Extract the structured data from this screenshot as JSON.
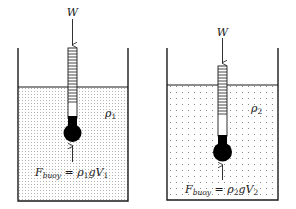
{
  "diagram": {
    "type": "physics-buoyancy-hydrometer",
    "colors": {
      "line": "#1a1a1a",
      "liquid_dots": "#8a8a8a",
      "bulb": "#000000",
      "background": "#ffffff"
    },
    "beakers": [
      {
        "id": "left",
        "weight_label": "W",
        "density_label": "ρ",
        "density_sub": "1",
        "formula": {
          "lhs": "F",
          "lhs_sub": "buoy",
          "eq": " = ",
          "rho": "ρ",
          "rho_sub": "1",
          "g": "g",
          "V": "V",
          "V_sub": "1"
        }
      },
      {
        "id": "right",
        "weight_label": "W",
        "density_label": "ρ",
        "density_sub": "2",
        "formula": {
          "lhs": "F",
          "lhs_sub": "buoy",
          "eq": " = ",
          "rho": "ρ",
          "rho_sub": "2",
          "g": "g",
          "V": "V",
          "V_sub": "2"
        }
      }
    ]
  }
}
